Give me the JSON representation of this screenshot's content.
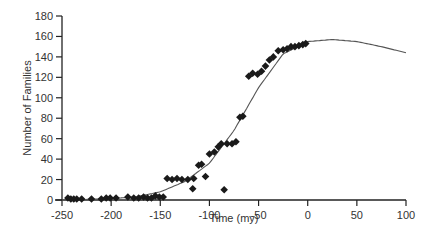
{
  "chart_data": {
    "type": "scatter",
    "title": "",
    "xlabel": "Time (my)",
    "ylabel": "Number of Families",
    "xlim": [
      -250,
      100
    ],
    "ylim": [
      0,
      180
    ],
    "xticks": [
      -250,
      -200,
      -150,
      -100,
      -50,
      0,
      50,
      100
    ],
    "yticks": [
      0,
      20,
      40,
      60,
      80,
      100,
      120,
      140,
      160,
      180
    ],
    "grid": false,
    "legend": null,
    "series": [
      {
        "name": "Observed families",
        "marker": "diamond",
        "color": "#1a1a1a",
        "points": [
          [
            -244,
            2
          ],
          [
            -241,
            1
          ],
          [
            -238,
            1
          ],
          [
            -235,
            1
          ],
          [
            -230,
            1
          ],
          [
            -220,
            1
          ],
          [
            -210,
            1
          ],
          [
            -205,
            2
          ],
          [
            -201,
            2
          ],
          [
            -195,
            2
          ],
          [
            -183,
            3
          ],
          [
            -177,
            2
          ],
          [
            -172,
            2
          ],
          [
            -167,
            3
          ],
          [
            -163,
            2
          ],
          [
            -159,
            2
          ],
          [
            -155,
            4
          ],
          [
            -151,
            3
          ],
          [
            -147,
            3
          ],
          [
            -143,
            21
          ],
          [
            -138,
            20
          ],
          [
            -133,
            21
          ],
          [
            -128,
            20
          ],
          [
            -122,
            20
          ],
          [
            -117,
            11
          ],
          [
            -116,
            21
          ],
          [
            -111,
            34
          ],
          [
            -108,
            35
          ],
          [
            -104,
            23
          ],
          [
            -100,
            45
          ],
          [
            -95,
            47
          ],
          [
            -91,
            52
          ],
          [
            -88,
            55
          ],
          [
            -85,
            10
          ],
          [
            -82,
            55
          ],
          [
            -77,
            55
          ],
          [
            -73,
            57
          ],
          [
            -69,
            81
          ],
          [
            -66,
            82
          ],
          [
            -60,
            121
          ],
          [
            -56,
            124
          ],
          [
            -51,
            123
          ],
          [
            -47,
            126
          ],
          [
            -43,
            131
          ],
          [
            -39,
            137
          ],
          [
            -35,
            140
          ],
          [
            -30,
            146
          ],
          [
            -25,
            147
          ],
          [
            -21,
            148
          ],
          [
            -17,
            150
          ],
          [
            -13,
            150
          ],
          [
            -9,
            151
          ],
          [
            -5,
            152
          ],
          [
            -2,
            153
          ]
        ]
      },
      {
        "name": "Logistic fit",
        "type": "line",
        "color": "#555555",
        "x": [
          -250,
          -225,
          -200,
          -175,
          -150,
          -125,
          -100,
          -75,
          -50,
          -25,
          0,
          25,
          50,
          75,
          100
        ],
        "y": [
          0,
          0.5,
          1.5,
          3,
          8,
          18,
          36,
          68,
          110,
          143,
          155,
          157,
          155,
          150,
          144
        ]
      }
    ]
  }
}
